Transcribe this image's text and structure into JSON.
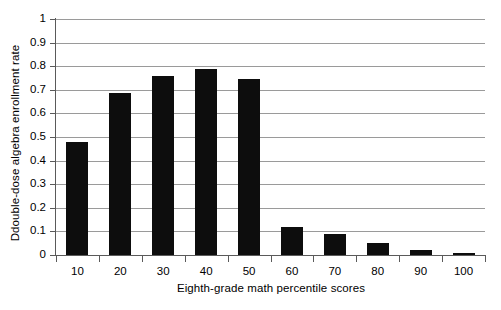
{
  "chart_data": {
    "type": "bar",
    "title": "",
    "xlabel": "Eighth-grade math percentile scores",
    "ylabel": "Ddouble-dose algebra enrollment rate",
    "categories": [
      "10",
      "20",
      "30",
      "40",
      "50",
      "60",
      "70",
      "80",
      "90",
      "100"
    ],
    "values": [
      0.48,
      0.685,
      0.76,
      0.79,
      0.745,
      0.12,
      0.09,
      0.05,
      0.02,
      0.01
    ],
    "ylim": [
      0,
      1
    ],
    "ytick_labels": [
      "0",
      "0.1",
      "0.2",
      "0.3",
      "0.4",
      "0.5",
      "0.6",
      "0.7",
      "0.8",
      "0.9",
      "1"
    ],
    "ytick_values": [
      0,
      0.1,
      0.2,
      0.3,
      0.4,
      0.5,
      0.6,
      0.7,
      0.8,
      0.9,
      1
    ],
    "grid": "horizontal",
    "legend": "none",
    "bar_color": "#0d0d0d",
    "grid_color": "#9a9a9a",
    "axis_color": "#5a5a5a",
    "background": "#ffffff"
  }
}
